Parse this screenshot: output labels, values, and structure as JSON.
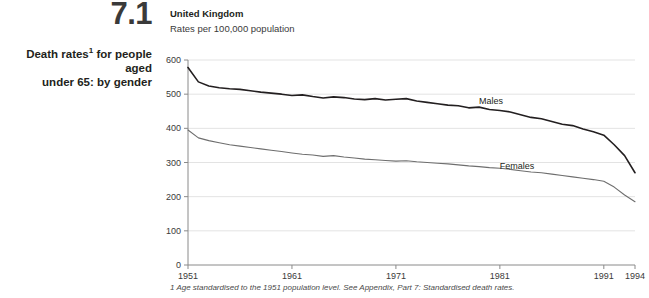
{
  "figure": {
    "number": "7.1",
    "caption_line1": "Death rates",
    "caption_footnote_marker": "1",
    "caption_line1_rest": " for people aged",
    "caption_line2": "under 65: by gender"
  },
  "footnote": "1 Age standardised to the 1951 population level. See Appendix, Part 7: Standardised death rates.",
  "colors": {
    "males_line": "#231f20",
    "females_line": "#6e6e6e",
    "axis": "#8a8a8a",
    "gridline": "#e3e3e3",
    "text": "#3a3a3a"
  },
  "chart_data": {
    "type": "line",
    "title": "United Kingdom",
    "subtitle": "Rates per 100,000 population",
    "xlabel": "",
    "ylabel": "Rates per 100,000 population",
    "ylim": [
      0,
      600
    ],
    "xlim": [
      1951,
      1994
    ],
    "yticks": [
      0,
      100,
      200,
      300,
      400,
      500,
      600
    ],
    "xticks": [
      1951,
      1961,
      1971,
      1981,
      1991,
      1994
    ],
    "grid": true,
    "legend_position": "inline-labels",
    "x": [
      1951,
      1952,
      1953,
      1954,
      1955,
      1956,
      1957,
      1958,
      1959,
      1960,
      1961,
      1962,
      1963,
      1964,
      1965,
      1966,
      1967,
      1968,
      1969,
      1970,
      1971,
      1972,
      1973,
      1974,
      1975,
      1976,
      1977,
      1978,
      1979,
      1980,
      1981,
      1982,
      1983,
      1984,
      1985,
      1986,
      1987,
      1988,
      1989,
      1990,
      1991,
      1992,
      1993,
      1994
    ],
    "series": [
      {
        "name": "Males",
        "label": "Males",
        "color": "#231f20",
        "values": [
          578,
          536,
          524,
          519,
          516,
          514,
          510,
          506,
          503,
          500,
          496,
          498,
          493,
          489,
          492,
          490,
          486,
          484,
          487,
          483,
          485,
          487,
          480,
          476,
          472,
          468,
          466,
          460,
          462,
          455,
          452,
          448,
          440,
          432,
          428,
          420,
          412,
          408,
          398,
          390,
          380,
          352,
          320,
          270
        ]
      },
      {
        "name": "Females",
        "label": "Females",
        "color": "#6e6e6e",
        "values": [
          395,
          372,
          364,
          358,
          352,
          348,
          344,
          340,
          336,
          332,
          328,
          324,
          322,
          318,
          320,
          316,
          313,
          310,
          308,
          306,
          304,
          305,
          302,
          300,
          298,
          296,
          293,
          290,
          288,
          285,
          283,
          280,
          276,
          272,
          270,
          266,
          262,
          258,
          254,
          250,
          245,
          228,
          205,
          185
        ]
      }
    ],
    "annotations": [
      {
        "text": "Males",
        "x": 1979,
        "y": 470
      },
      {
        "text": "Females",
        "x": 1981,
        "y": 280
      }
    ]
  }
}
